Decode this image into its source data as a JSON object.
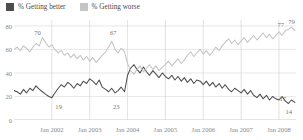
{
  "legend": {
    "position": "top-left",
    "entries": [
      {
        "label": "% Getting better",
        "color": "#4d4d4d",
        "swatch_name": "legend-swatch-better"
      },
      {
        "label": "% Getting worse",
        "color": "#c4c4c4",
        "swatch_name": "legend-swatch-worse"
      }
    ]
  },
  "chart_data": {
    "type": "line",
    "title": "",
    "subtitle": "",
    "xlabel": "",
    "ylabel": "",
    "xlim": [
      2001.0,
      2008.45
    ],
    "ylim": [
      0,
      85
    ],
    "yticks": [
      0,
      20,
      40,
      60,
      80
    ],
    "ytick_labels": [
      "0",
      "20",
      "40",
      "60",
      "80"
    ],
    "xticks": [
      2002,
      2003,
      2004,
      2005,
      2006,
      2007,
      2008
    ],
    "xtick_labels": [
      "Jan 2002",
      "Jan 2003",
      "Jan 2004",
      "Jan 2005",
      "Jan 2006",
      "Jan 2007",
      "Jan 2008"
    ],
    "grid": true,
    "legend_position": "top-left",
    "colors": {
      "better": "#4d4d4d",
      "worse": "#c4c4c4"
    },
    "annotations": [
      {
        "text": "70",
        "x": 2001.62,
        "y": 75,
        "series": "% Getting worse"
      },
      {
        "text": "19",
        "x": 2002.18,
        "y": 12,
        "series": "% Getting better"
      },
      {
        "text": "67",
        "x": 2003.62,
        "y": 75,
        "series": "% Getting worse"
      },
      {
        "text": "23",
        "x": 2003.7,
        "y": 12,
        "series": "% Getting better"
      },
      {
        "text": "77",
        "x": 2008.05,
        "y": 82,
        "series": "% Getting worse"
      },
      {
        "text": "79",
        "x": 2008.33,
        "y": 84,
        "series": "% Getting worse"
      },
      {
        "text": "17",
        "x": 2008.1,
        "y": 19,
        "series": "% Getting better"
      },
      {
        "text": "14",
        "x": 2008.26,
        "y": 8,
        "series": "% Getting better"
      }
    ],
    "series": [
      {
        "name": "% Getting better",
        "color": "#4d4d4d",
        "x": [
          2001.0,
          2001.08,
          2001.17,
          2001.25,
          2001.33,
          2001.42,
          2001.5,
          2001.58,
          2001.67,
          2001.75,
          2001.83,
          2001.92,
          2002.0,
          2002.08,
          2002.17,
          2002.25,
          2002.33,
          2002.42,
          2002.5,
          2002.58,
          2002.67,
          2002.75,
          2002.83,
          2002.92,
          2003.0,
          2003.08,
          2003.17,
          2003.25,
          2003.33,
          2003.42,
          2003.5,
          2003.58,
          2003.67,
          2003.75,
          2003.83,
          2003.92,
          2004.0,
          2004.08,
          2004.17,
          2004.25,
          2004.33,
          2004.42,
          2004.5,
          2004.58,
          2004.67,
          2004.75,
          2004.83,
          2004.92,
          2005.0,
          2005.08,
          2005.17,
          2005.25,
          2005.33,
          2005.42,
          2005.5,
          2005.58,
          2005.67,
          2005.75,
          2005.83,
          2005.92,
          2006.0,
          2006.08,
          2006.17,
          2006.25,
          2006.33,
          2006.42,
          2006.5,
          2006.58,
          2006.67,
          2006.75,
          2006.83,
          2006.92,
          2007.0,
          2007.08,
          2007.17,
          2007.25,
          2007.33,
          2007.42,
          2007.5,
          2007.58,
          2007.67,
          2007.75,
          2007.83,
          2007.92,
          2008.0,
          2008.08,
          2008.17,
          2008.25,
          2008.33,
          2008.42
        ],
        "values": [
          25,
          24,
          22,
          26,
          23,
          27,
          25,
          29,
          26,
          24,
          22,
          20,
          19,
          23,
          27,
          30,
          28,
          32,
          30,
          27,
          31,
          29,
          33,
          31,
          35,
          33,
          30,
          34,
          28,
          26,
          24,
          27,
          23,
          25,
          28,
          24,
          38,
          44,
          47,
          43,
          40,
          45,
          41,
          38,
          42,
          39,
          36,
          40,
          37,
          35,
          38,
          34,
          37,
          33,
          36,
          32,
          35,
          31,
          34,
          33,
          30,
          33,
          29,
          32,
          28,
          31,
          27,
          30,
          26,
          24,
          27,
          25,
          23,
          26,
          22,
          25,
          21,
          19,
          22,
          18,
          21,
          17,
          20,
          18,
          17,
          20,
          16,
          14,
          17,
          15
        ]
      },
      {
        "name": "% Getting worse",
        "color": "#c4c4c4",
        "x": [
          2001.0,
          2001.08,
          2001.17,
          2001.25,
          2001.33,
          2001.42,
          2001.5,
          2001.58,
          2001.67,
          2001.75,
          2001.83,
          2001.92,
          2002.0,
          2002.08,
          2002.17,
          2002.25,
          2002.33,
          2002.42,
          2002.5,
          2002.58,
          2002.67,
          2002.75,
          2002.83,
          2002.92,
          2003.0,
          2003.08,
          2003.17,
          2003.25,
          2003.33,
          2003.42,
          2003.5,
          2003.58,
          2003.67,
          2003.75,
          2003.83,
          2003.92,
          2004.0,
          2004.08,
          2004.17,
          2004.25,
          2004.33,
          2004.42,
          2004.5,
          2004.58,
          2004.67,
          2004.75,
          2004.83,
          2004.92,
          2005.0,
          2005.08,
          2005.17,
          2005.25,
          2005.33,
          2005.42,
          2005.5,
          2005.58,
          2005.67,
          2005.75,
          2005.83,
          2005.92,
          2006.0,
          2006.08,
          2006.17,
          2006.25,
          2006.33,
          2006.42,
          2006.5,
          2006.58,
          2006.67,
          2006.75,
          2006.83,
          2006.92,
          2007.0,
          2007.08,
          2007.17,
          2007.25,
          2007.33,
          2007.42,
          2007.5,
          2007.58,
          2007.67,
          2007.75,
          2007.83,
          2007.92,
          2008.0,
          2008.08,
          2008.17,
          2008.25,
          2008.33,
          2008.42
        ],
        "values": [
          60,
          62,
          59,
          63,
          61,
          58,
          62,
          65,
          63,
          70,
          66,
          62,
          64,
          60,
          57,
          59,
          55,
          57,
          53,
          56,
          52,
          55,
          51,
          54,
          50,
          53,
          49,
          52,
          55,
          58,
          62,
          67,
          60,
          57,
          61,
          58,
          48,
          42,
          39,
          43,
          46,
          41,
          44,
          47,
          43,
          46,
          42,
          45,
          47,
          50,
          46,
          49,
          52,
          48,
          51,
          55,
          58,
          54,
          57,
          60,
          56,
          59,
          55,
          58,
          62,
          59,
          63,
          66,
          69,
          65,
          68,
          64,
          67,
          70,
          66,
          69,
          72,
          68,
          71,
          74,
          70,
          73,
          69,
          72,
          75,
          72,
          76,
          77,
          79,
          76
        ]
      }
    ]
  }
}
